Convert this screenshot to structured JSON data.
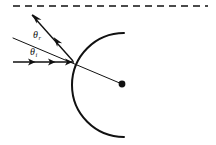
{
  "figure": {
    "background_color": "#ffffff",
    "stroke_color": "#111111",
    "width": 216,
    "height": 145
  },
  "labels": {
    "angle_of_reflection": {
      "symbol": "θ",
      "subscript": "r",
      "name": "theta-r",
      "x": 33,
      "y": 37
    },
    "angle_of_incidence": {
      "symbol": "θ",
      "subscript": "i",
      "name": "theta-i",
      "x": 30,
      "y": 54
    }
  },
  "elements": {
    "axis_dashed_line": {
      "name": "optical-axis-dashed-line",
      "x1": 13,
      "y1": 6,
      "x2": 208,
      "y2": 6,
      "dash": "7 5",
      "width": 1.6
    },
    "incident_ray": {
      "name": "incident-ray",
      "x1": 13,
      "y1": 62,
      "x2": 74,
      "y2": 62,
      "width": 1.4,
      "arrow_positions": [
        0.33,
        0.62,
        0.92
      ]
    },
    "reflected_ray": {
      "name": "reflected-ray",
      "x1": 73,
      "y1": 61,
      "x2": 31,
      "y2": 14,
      "width": 1.4,
      "arrow_positions": [
        0.42,
        0.95
      ]
    },
    "normal_line": {
      "name": "normal-radius-line",
      "x1": 13,
      "y1": 38,
      "x2": 122,
      "y2": 84,
      "width": 1.0
    },
    "mirror_arc": {
      "name": "concave-mirror-arc",
      "center_x": 122,
      "center_y": 84,
      "radius": 51,
      "start_x": 124,
      "start_y": 33,
      "end_x": 124,
      "end_y": 137,
      "width": 2.0
    },
    "center_of_curvature": {
      "name": "center-of-curvature-dot",
      "cx": 122,
      "cy": 84,
      "r": 3.4
    }
  }
}
